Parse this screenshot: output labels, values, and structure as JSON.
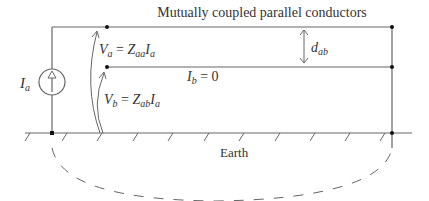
{
  "title": "Mutually coupled parallel conductors",
  "source_label": {
    "main": "I",
    "sub": "a"
  },
  "voltage_a": {
    "lhs_main": "V",
    "lhs_sub": "a",
    "eq": " = ",
    "z_main": "Z",
    "z_sub": "aa",
    "i_main": "I",
    "i_sub": "a"
  },
  "voltage_b": {
    "lhs_main": "V",
    "lhs_sub": "b",
    "eq": " = ",
    "z_main": "Z",
    "z_sub": "ab",
    "i_main": "I",
    "i_sub": "a"
  },
  "current_b": {
    "main": "I",
    "sub": "b",
    "value": " = 0"
  },
  "distance": {
    "main": "d",
    "sub": "ab"
  },
  "earth_label": "Earth",
  "colors": {
    "line": "#555555",
    "dot": "#111111",
    "text": "#333333"
  }
}
